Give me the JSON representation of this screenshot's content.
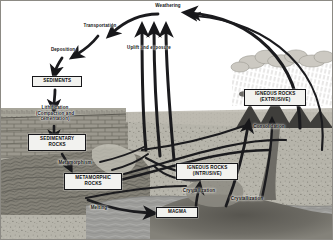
{
  "diagram": {
    "palette": {
      "sky": "#ffffff",
      "sediment_layer": "#b9b6ac",
      "sedimentary_brick": "#8f8c83",
      "metamorphic": "#7c7a72",
      "deep_rock": "#b2b0a6",
      "magma_chamber": "#6d6b64",
      "water": "#9a9a97",
      "mountain": "#3c3b39",
      "cloud": "#cfcdc7",
      "arrow": "#1b1b1e",
      "box_fill": "#f2f2ef",
      "box_border": "#17171a",
      "frame": "#8c8a84"
    },
    "boxes": [
      {
        "id": "sediments",
        "label": "SEDIMENTS"
      },
      {
        "id": "sedimentary-rocks",
        "label": "SEDIMENTARY\nROCKS"
      },
      {
        "id": "metamorphic-rocks",
        "label": "METAMORPHIC\nROCKS"
      },
      {
        "id": "igneous-rocks-intrusive",
        "label": "IGNEOUS ROCKS\n(INTRUSIVE)"
      },
      {
        "id": "igneous-rocks-extrusive",
        "label": "IGNEOUS ROCKS\n(EXTRUSIVE)"
      },
      {
        "id": "magma",
        "label": "MAGMA"
      }
    ],
    "processes": [
      {
        "id": "weathering",
        "label": "Weathering"
      },
      {
        "id": "transportation",
        "label": "Transportation"
      },
      {
        "id": "deposition",
        "label": "Deposition"
      },
      {
        "id": "lithification",
        "label": "Lithification\n(Compaction and\ncementation)"
      },
      {
        "id": "uplift-exposure",
        "label": "Uplift and exposure"
      },
      {
        "id": "metamorphism",
        "label": "Metamorphism"
      },
      {
        "id": "melting",
        "label": "Melting"
      },
      {
        "id": "crystallization-deep",
        "label": "Crystallization"
      },
      {
        "id": "crystallization-intrusive",
        "label": "Crystallization"
      },
      {
        "id": "consolidation",
        "label": "Consolidation"
      }
    ],
    "scene_features": [
      {
        "id": "rain-cloud",
        "label": "rain-cloud"
      },
      {
        "id": "volcano",
        "label": "volcano"
      },
      {
        "id": "ocean",
        "label": "ocean"
      },
      {
        "id": "magma-chamber",
        "label": "magma-chamber"
      }
    ]
  }
}
